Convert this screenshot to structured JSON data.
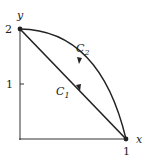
{
  "diagram": {
    "axes": {
      "x_label": "x",
      "y_label": "y",
      "x_ticks": [
        "1"
      ],
      "y_ticks": [
        "1",
        "2"
      ]
    },
    "points": [
      {
        "name": "A",
        "coords": [
          0,
          2
        ]
      },
      {
        "name": "B",
        "coords": [
          1,
          0
        ]
      }
    ],
    "curves": [
      {
        "name": "C1",
        "label_main": "C",
        "label_sub": "1",
        "type": "straight line",
        "from": [
          1,
          0
        ],
        "to": [
          0,
          2
        ],
        "direction": "toward (0,2)"
      },
      {
        "name": "C2",
        "label_main": "C",
        "label_sub": "2",
        "type": "curved arc",
        "from": [
          1,
          0
        ],
        "to": [
          0,
          2
        ],
        "direction": "toward (0,2)"
      }
    ],
    "colors": {
      "stroke": "#222222",
      "background": "#ffffff"
    }
  }
}
